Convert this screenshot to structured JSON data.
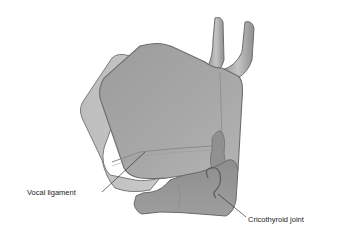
{
  "diagram": {
    "labels": [
      {
        "id": "vocal-ligament",
        "text": "Vocal ligament"
      },
      {
        "id": "cricothyroid-joint",
        "text": "Cricothyroid joint"
      }
    ],
    "colors": {
      "cartilage_fill": "#a9a9a9",
      "cartilage_dark": "#8c8c8c",
      "cartilage_light": "#c8c8c8",
      "outline": "#6e6e6e",
      "leader_line": "#333333",
      "background": "#ffffff"
    }
  }
}
